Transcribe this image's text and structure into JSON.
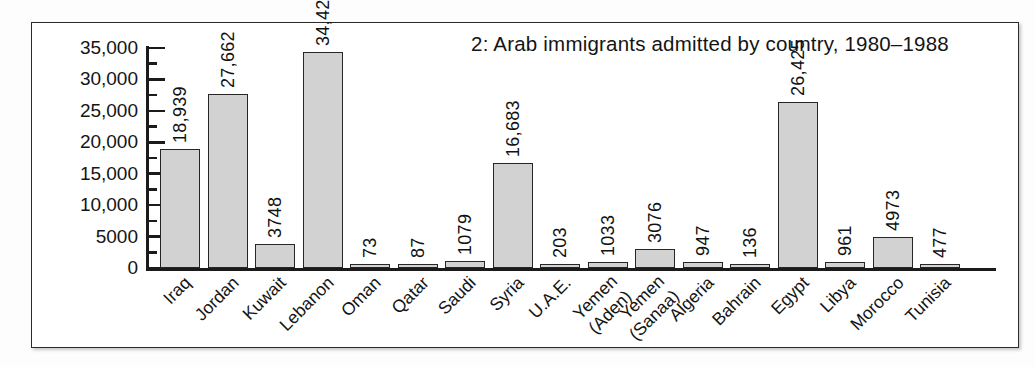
{
  "chart_data": {
    "type": "bar",
    "title": "2: Arab immigrants admitted by country, 1980–1988",
    "xlabel": "",
    "ylabel": "",
    "ylim": [
      0,
      35000
    ],
    "grid": false,
    "legend": "none",
    "y_ticks": [
      "0",
      "5000",
      "10,000",
      "15,000",
      "20,000",
      "25,000",
      "30,000",
      "35,000"
    ],
    "y_tick_values": [
      0,
      5000,
      10000,
      15000,
      20000,
      25000,
      30000,
      35000
    ],
    "minor_tick_interval": 2500,
    "categories": [
      "Iraq",
      "Jordan",
      "Kuwait",
      "Lebanon",
      "Oman",
      "Qatar",
      "Saudi",
      "Syria",
      "U.A.E.",
      "Yemen (Aden)",
      "Yemen (Sanaa)",
      "Algeria",
      "Bahrain",
      "Egypt",
      "Libya",
      "Morocco",
      "Tunisia"
    ],
    "values": [
      18939,
      27662,
      3748,
      34420,
      73,
      87,
      1079,
      16683,
      203,
      1033,
      3076,
      947,
      136,
      26425,
      961,
      4973,
      477
    ],
    "bars": [
      {
        "category": "Iraq",
        "label_line1": "Iraq",
        "label_line2": "",
        "value": 18939,
        "value_label": "18,939"
      },
      {
        "category": "Jordan",
        "label_line1": "Jordan",
        "label_line2": "",
        "value": 27662,
        "value_label": "27,662"
      },
      {
        "category": "Kuwait",
        "label_line1": "Kuwait",
        "label_line2": "",
        "value": 3748,
        "value_label": "3748"
      },
      {
        "category": "Lebanon",
        "label_line1": "Lebanon",
        "label_line2": "",
        "value": 34420,
        "value_label": "34,420"
      },
      {
        "category": "Oman",
        "label_line1": "Oman",
        "label_line2": "",
        "value": 73,
        "value_label": "73"
      },
      {
        "category": "Qatar",
        "label_line1": "Qatar",
        "label_line2": "",
        "value": 87,
        "value_label": "87"
      },
      {
        "category": "Saudi",
        "label_line1": "Saudi",
        "label_line2": "",
        "value": 1079,
        "value_label": "1079"
      },
      {
        "category": "Syria",
        "label_line1": "Syria",
        "label_line2": "",
        "value": 16683,
        "value_label": "16,683"
      },
      {
        "category": "U.A.E.",
        "label_line1": "U.A.E.",
        "label_line2": "",
        "value": 203,
        "value_label": "203"
      },
      {
        "category": "Yemen (Aden)",
        "label_line1": "Yemen",
        "label_line2": "(Aden)",
        "value": 1033,
        "value_label": "1033"
      },
      {
        "category": "Yemen (Sanaa)",
        "label_line1": "Yemen",
        "label_line2": "(Sanaa)",
        "value": 3076,
        "value_label": "3076"
      },
      {
        "category": "Algeria",
        "label_line1": "Algeria",
        "label_line2": "",
        "value": 947,
        "value_label": "947"
      },
      {
        "category": "Bahrain",
        "label_line1": "Bahrain",
        "label_line2": "",
        "value": 136,
        "value_label": "136"
      },
      {
        "category": "Egypt",
        "label_line1": "Egypt",
        "label_line2": "",
        "value": 26425,
        "value_label": "26,425"
      },
      {
        "category": "Libya",
        "label_line1": "Libya",
        "label_line2": "",
        "value": 961,
        "value_label": "961"
      },
      {
        "category": "Morocco",
        "label_line1": "Morocco",
        "label_line2": "",
        "value": 4973,
        "value_label": "4973"
      },
      {
        "category": "Tunisia",
        "label_line1": "Tunisia",
        "label_line2": "",
        "value": 477,
        "value_label": "477"
      }
    ],
    "colors": {
      "bar_fill": "#d2d2d2",
      "bar_edge": "#262626",
      "axis": "#1b1b1b",
      "text": "#141414",
      "frame": "#2b2b2b",
      "page_background": "#fdfdfd",
      "plot_background": "#ffffff"
    }
  }
}
